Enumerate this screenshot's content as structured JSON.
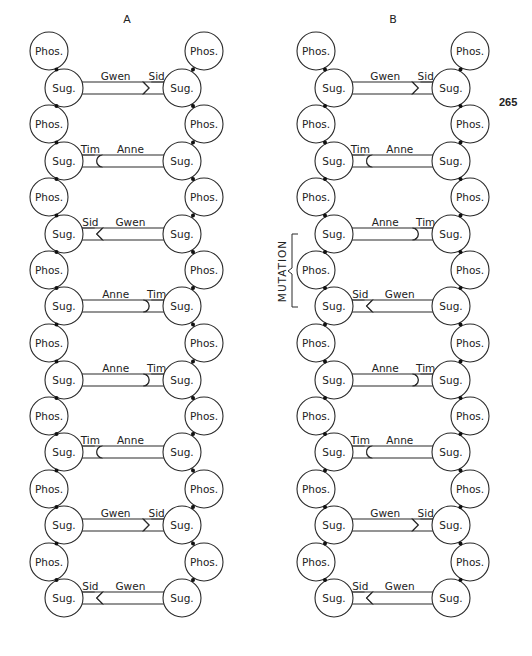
{
  "page_number": "265",
  "labels": {
    "phosphate": "Phos.",
    "sugar": "Sug."
  },
  "panels": [
    {
      "title": "A",
      "rungs": [
        {
          "left": "Gwen",
          "right": "Sid"
        },
        {
          "left": "Tim",
          "right": "Anne"
        },
        {
          "left": "Sid",
          "right": "Gwen"
        },
        {
          "left": "Anne",
          "right": "Tim"
        },
        {
          "left": "Anne",
          "right": "Tim"
        },
        {
          "left": "Tim",
          "right": "Anne"
        },
        {
          "left": "Gwen",
          "right": "Sid"
        },
        {
          "left": "Sid",
          "right": "Gwen"
        }
      ]
    },
    {
      "title": "B",
      "rungs": [
        {
          "left": "Gwen",
          "right": "Sid"
        },
        {
          "left": "Tim",
          "right": "Anne"
        },
        {
          "left": "Anne",
          "right": "Tim"
        },
        {
          "left": "Sid",
          "right": "Gwen"
        },
        {
          "left": "Anne",
          "right": "Tim"
        },
        {
          "left": "Tim",
          "right": "Anne"
        },
        {
          "left": "Gwen",
          "right": "Sid"
        },
        {
          "left": "Sid",
          "right": "Gwen"
        }
      ],
      "annotation": {
        "text": "MUTATION",
        "spans_rungs": [
          3,
          4
        ]
      }
    }
  ],
  "colors": {
    "stroke": "#2a2a2a",
    "background": "#ffffff"
  }
}
